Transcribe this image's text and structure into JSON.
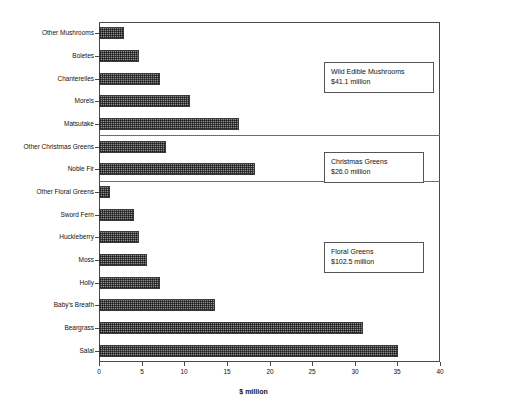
{
  "chart_data": {
    "type": "bar",
    "orientation": "horizontal",
    "title": "",
    "xlabel": "$ million",
    "ylabel": "",
    "xlim": [
      0,
      40
    ],
    "xticks": [
      0,
      5,
      10,
      15,
      20,
      25,
      30,
      35,
      40
    ],
    "grid": false,
    "legend": "none",
    "categories": [
      "Other Mushrooms",
      "Boletes",
      "Chanterelles",
      "Morels",
      "Matsutake",
      "Other Christmas Greens",
      "Noble Fir",
      "Other Floral Greens",
      "Sword Fern",
      "Huckleberry",
      "Moss",
      "Holly",
      "Baby's Breath",
      "Beargrass",
      "Salal"
    ],
    "values": [
      2.9,
      4.7,
      7.2,
      10.7,
      16.4,
      7.9,
      18.3,
      1.3,
      4.1,
      4.7,
      5.6,
      7.2,
      13.6,
      31.0,
      35.1
    ],
    "groups": [
      {
        "name": "Wild Edible Mushrooms",
        "total": "$41.1 million",
        "categories": [
          "Other Mushrooms",
          "Boletes",
          "Chanterelles",
          "Morels",
          "Matsutake"
        ]
      },
      {
        "name": "Christmas Greens",
        "total": "$26.0 million",
        "categories": [
          "Other Christmas Greens",
          "Noble Fir"
        ]
      },
      {
        "name": "Floral Greens",
        "total": "$102.5 million",
        "categories": [
          "Other Floral Greens",
          "Sword Fern",
          "Huckleberry",
          "Moss",
          "Holly",
          "Baby's Breath",
          "Beargrass",
          "Salal"
        ]
      }
    ]
  },
  "annotations": [
    {
      "line1": "Wild Edible Mushrooms",
      "line2": "$41.1 million"
    },
    {
      "line1": "Christmas Greens",
      "line2": "$26.0 million"
    },
    {
      "line1": "Floral Greens",
      "line2": "$102.5 million"
    }
  ],
  "axis": {
    "x_title": "$ million",
    "x_tick_labels": [
      "0",
      "5",
      "10",
      "15",
      "20",
      "25",
      "30",
      "35",
      "40"
    ]
  },
  "colors": {
    "bar_fill": "#8e8e8e",
    "bar_border": "#3a3a3a",
    "axis": "#4a4a4a",
    "separator": "#6d6d6d",
    "text": "#111111",
    "background": "#ffffff"
  }
}
